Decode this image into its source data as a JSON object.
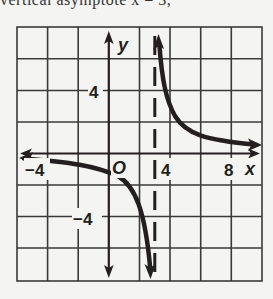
{
  "header": {
    "cut_text": "vertical asymptote x = 3,"
  },
  "graph": {
    "function": "y = 4/(x - 3)",
    "x_axis_label": "x",
    "y_axis_label": "y",
    "origin_label": "O",
    "x_tick_labels": [
      "−4",
      "4",
      "8"
    ],
    "y_tick_labels": [
      "4",
      "−4"
    ],
    "x_range": [
      -6,
      10
    ],
    "y_range": [
      -10,
      8
    ],
    "grid_step": 2,
    "vertical_asymptote": "x = 3",
    "horizontal_asymptote": "y = 0",
    "colors": {
      "ink": "#231f20",
      "grid": "#3a3a3a",
      "background": "#f4f4f2"
    }
  }
}
